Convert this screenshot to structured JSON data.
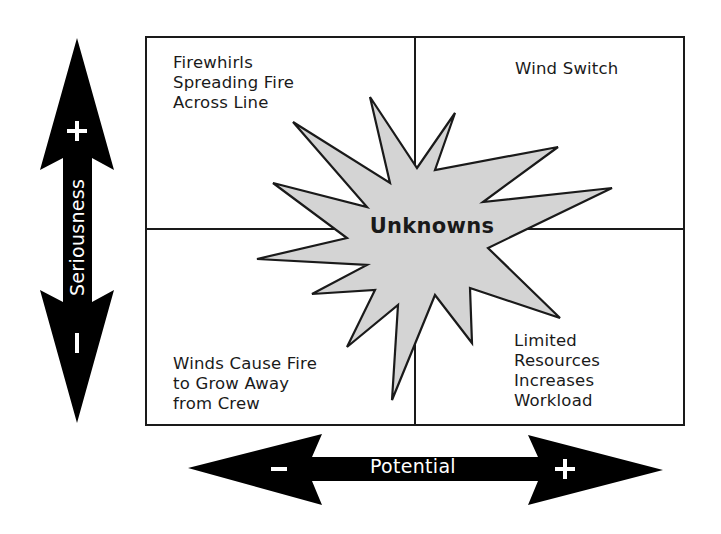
{
  "diagram": {
    "type": "risk-quadrant",
    "center": {
      "label": "Unknowns",
      "shape": "starburst",
      "fill": "#d4d4d4"
    },
    "quadrants": {
      "top_left": {
        "lines": [
          "Firewhirls",
          "Spreading Fire",
          "Across Line"
        ]
      },
      "top_right": {
        "lines": [
          "Wind Switch"
        ]
      },
      "bottom_left": {
        "lines": [
          "Winds Cause Fire",
          "to Grow Away",
          "from Crew"
        ]
      },
      "bottom_right": {
        "lines": [
          "Limited",
          "Resources",
          "Increases",
          "Workload"
        ]
      }
    },
    "axes": {
      "vertical": {
        "label": "Seriousness",
        "top_sign": "+",
        "bottom_sign": "–"
      },
      "horizontal": {
        "label": "Potential",
        "left_sign": "–",
        "right_sign": "+"
      }
    },
    "colors": {
      "stroke": "#1a1a1a",
      "arrow": "#000000",
      "star_fill": "#d4d4d4",
      "background": "#ffffff"
    }
  }
}
